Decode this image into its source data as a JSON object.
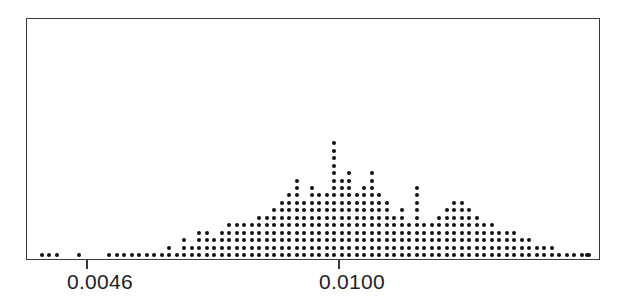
{
  "figure": {
    "name": "dot-plot-figure",
    "background_color": "#ffffff",
    "frame_color": "#3a3a3a",
    "dot_color": "#111111"
  },
  "axis": {
    "ticks": [
      {
        "label": "0.0046",
        "value": 0.0046,
        "x_px": 86
      },
      {
        "label": "0.0100",
        "value": 0.01,
        "x_px": 338
      }
    ]
  },
  "chart_data": {
    "type": "bar",
    "render_style": "dot-plot",
    "title": "",
    "subtitle": "",
    "xlabel": "",
    "ylabel": "",
    "legend": [],
    "grid": false,
    "xlim": [
      0.00325,
      0.01585
    ],
    "ylim": [
      0,
      22
    ],
    "x_tick_labels": [
      "0.0046",
      "0.0100"
    ],
    "x_tick_values": [
      0.0046,
      0.01
    ],
    "bin_width": 0.00016071,
    "dot_diameter_px": 4,
    "column_spacing_px": 7.5,
    "row_spacing_px": 7.45,
    "categories": [
      0.003339,
      0.0035,
      0.003661,
      0.003821,
      0.003982,
      0.004143,
      0.004303,
      0.004464,
      0.004625,
      0.004786,
      0.004946,
      0.005107,
      0.005268,
      0.005428,
      0.005589,
      0.00575,
      0.005911,
      0.006071,
      0.006232,
      0.006393,
      0.006554,
      0.006714,
      0.006875,
      0.007036,
      0.007196,
      0.007357,
      0.007518,
      0.007679,
      0.007839,
      0.008,
      0.008161,
      0.008321,
      0.008482,
      0.008643,
      0.008804,
      0.008964,
      0.009125,
      0.009286,
      0.009446,
      0.009607,
      0.009768,
      0.009929,
      0.010089,
      0.01025,
      0.010411,
      0.010571,
      0.010732,
      0.010893,
      0.011054,
      0.011214,
      0.011375,
      0.011536,
      0.011696,
      0.011857,
      0.012018,
      0.012179,
      0.012339,
      0.0125,
      0.012661,
      0.012821,
      0.012982,
      0.013143,
      0.013304,
      0.013464,
      0.013625,
      0.013786,
      0.013946,
      0.014107,
      0.014268,
      0.014429,
      0.014589,
      0.01475,
      0.014911,
      0.015071,
      0.015232,
      0.015393,
      0.015554
    ],
    "values": [
      1,
      1,
      1,
      0,
      0,
      1,
      0,
      0,
      0,
      1,
      1,
      1,
      1,
      1,
      1,
      1,
      1,
      2,
      1,
      3,
      2,
      4,
      4,
      3,
      4,
      5,
      5,
      5,
      5,
      6,
      6,
      7,
      8,
      9,
      11,
      8,
      10,
      9,
      9,
      16,
      11,
      12,
      9,
      10,
      12,
      9,
      8,
      6,
      7,
      5,
      10,
      5,
      5,
      6,
      7,
      8,
      8,
      7,
      6,
      5,
      5,
      4,
      4,
      4,
      3,
      3,
      2,
      2,
      2,
      1,
      1,
      1,
      1,
      1,
      0,
      0,
      1
    ],
    "x_px_positions": [
      42,
      49,
      57,
      64,
      72,
      79,
      87,
      94,
      102,
      109,
      117,
      124,
      132,
      139,
      147,
      154,
      162,
      169,
      177,
      184,
      192,
      199,
      207,
      214,
      222,
      229,
      237,
      244,
      252,
      259,
      267,
      274,
      282,
      289,
      297,
      304,
      312,
      319,
      327,
      334,
      342,
      349,
      357,
      364,
      372,
      379,
      387,
      394,
      402,
      409,
      417,
      424,
      432,
      439,
      447,
      454,
      462,
      469,
      477,
      484,
      492,
      499,
      507,
      514,
      522,
      529,
      537,
      544,
      552,
      559,
      567,
      574,
      582,
      589,
      597,
      604,
      587
    ],
    "max_column_height": 16,
    "total_observations": 391,
    "annotations": []
  }
}
